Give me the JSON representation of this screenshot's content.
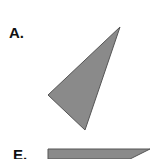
{
  "figures": [
    {
      "label": "A.",
      "shape": "triangle",
      "fill": "#8a8a8a",
      "stroke": "#555555"
    },
    {
      "label": "E.",
      "shape": "quadrilateral",
      "fill": "#8a8a8a",
      "stroke": "#555555"
    }
  ]
}
